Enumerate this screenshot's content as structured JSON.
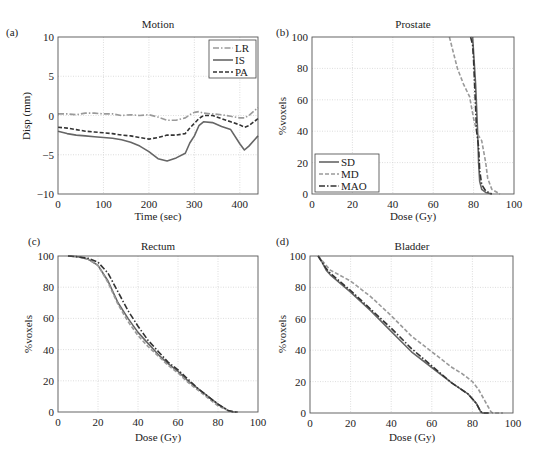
{
  "figure": {
    "panels": [
      {
        "id": "a",
        "label": "(a)",
        "title": "Motion",
        "xlabel": "Time (sec)",
        "ylabel": "Disp (mm)"
      },
      {
        "id": "b",
        "label": "(b)",
        "title": "Prostate",
        "xlabel": "Dose (Gy)",
        "ylabel": "%voxels"
      },
      {
        "id": "c",
        "label": "(c)",
        "title": "Rectum",
        "xlabel": "Dose (Gy)",
        "ylabel": "%voxels"
      },
      {
        "id": "d",
        "label": "(d)",
        "title": "Bladder",
        "xlabel": "Dose (Gy)",
        "ylabel": "%voxels"
      }
    ]
  },
  "chart_data": [
    {
      "panel": "(a)",
      "type": "line",
      "title": "Motion",
      "xlabel": "Time (sec)",
      "ylabel": "Disp (mm)",
      "xlim": [
        0,
        440
      ],
      "ylim": [
        -10,
        10
      ],
      "xticks": [
        0,
        100,
        200,
        300,
        400
      ],
      "yticks": [
        -10,
        -5,
        0,
        5,
        10
      ],
      "grid": true,
      "legend": {
        "position": "upper right",
        "entries": [
          "LR",
          "IS",
          "PA"
        ]
      },
      "x": [
        0,
        20,
        40,
        60,
        80,
        100,
        120,
        140,
        160,
        180,
        200,
        220,
        240,
        260,
        280,
        290,
        300,
        310,
        320,
        340,
        360,
        380,
        400,
        410,
        420,
        440
      ],
      "series": [
        {
          "name": "LR",
          "style": "dash-dot",
          "color": "#9a9a9a",
          "values": [
            0.2,
            0.2,
            0.1,
            0.3,
            0.3,
            0.2,
            0.2,
            0.0,
            0.1,
            0.0,
            0.1,
            -0.2,
            -0.6,
            -0.6,
            -0.3,
            0.1,
            0.4,
            0.5,
            0.3,
            0.2,
            0.1,
            -0.1,
            -0.3,
            -0.3,
            0.0,
            1.0
          ]
        },
        {
          "name": "IS",
          "style": "solid",
          "color": "#666666",
          "values": [
            -2.0,
            -2.3,
            -2.5,
            -2.6,
            -2.7,
            -2.8,
            -2.9,
            -3.1,
            -3.4,
            -3.9,
            -4.6,
            -5.5,
            -5.8,
            -5.4,
            -4.8,
            -3.5,
            -2.6,
            -1.3,
            -0.8,
            -0.9,
            -1.4,
            -1.8,
            -3.6,
            -4.4,
            -3.9,
            -2.6
          ]
        },
        {
          "name": "PA",
          "style": "dashed",
          "color": "#333333",
          "values": [
            -1.5,
            -1.6,
            -1.8,
            -2.0,
            -2.1,
            -2.2,
            -2.3,
            -2.5,
            -2.6,
            -2.8,
            -3.0,
            -2.8,
            -2.5,
            -2.5,
            -2.3,
            -1.6,
            -1.0,
            -0.4,
            0.0,
            0.0,
            -0.4,
            -0.8,
            -1.2,
            -1.5,
            -1.3,
            -0.4
          ]
        }
      ]
    },
    {
      "panel": "(b)",
      "type": "line",
      "title": "Prostate",
      "xlabel": "Dose (Gy)",
      "ylabel": "%voxels",
      "xlim": [
        0,
        100
      ],
      "ylim": [
        0,
        100
      ],
      "xticks": [
        0,
        20,
        40,
        60,
        80,
        100
      ],
      "yticks": [
        0,
        20,
        40,
        60,
        80,
        100
      ],
      "grid": true,
      "legend": {
        "position": "lower left",
        "entries": [
          "SD",
          "MD",
          "MAO"
        ]
      },
      "series": [
        {
          "name": "SD",
          "style": "solid",
          "color": "#666666",
          "x": [
            79.5,
            80.0,
            80.5,
            81.0,
            81.5,
            82.0,
            82.5,
            83.0,
            84.0,
            86.0,
            89.0
          ],
          "y": [
            100,
            90,
            80,
            70,
            55,
            40,
            20,
            8,
            3,
            1,
            0
          ]
        },
        {
          "name": "MD",
          "style": "dashed",
          "color": "#9a9a9a",
          "x": [
            68.0,
            70.0,
            72.0,
            75.0,
            78.0,
            80.0,
            82.0,
            84.0,
            86.0,
            87.0,
            89.0,
            93.0
          ],
          "y": [
            100,
            90,
            80,
            70,
            62,
            48,
            38,
            34,
            20,
            10,
            3,
            0
          ]
        },
        {
          "name": "MAO",
          "style": "dash-dot",
          "color": "#333333",
          "x": [
            78.5,
            79.5,
            80.0,
            80.5,
            81.0,
            81.5,
            82.5,
            83.0,
            84.0,
            86.0,
            89.0
          ],
          "y": [
            100,
            95,
            85,
            70,
            55,
            40,
            30,
            15,
            6,
            2,
            0
          ]
        }
      ]
    },
    {
      "panel": "(c)",
      "type": "line",
      "title": "Rectum",
      "xlabel": "Dose (Gy)",
      "ylabel": "%voxels",
      "xlim": [
        0,
        100
      ],
      "ylim": [
        0,
        100
      ],
      "xticks": [
        0,
        20,
        40,
        60,
        80,
        100
      ],
      "yticks": [
        0,
        20,
        40,
        60,
        80,
        100
      ],
      "grid": true,
      "series": [
        {
          "name": "SD",
          "style": "solid",
          "color": "#666666",
          "x": [
            5,
            10,
            15,
            20,
            25,
            30,
            35,
            40,
            45,
            50,
            55,
            60,
            65,
            70,
            75,
            80,
            85,
            88,
            90
          ],
          "y": [
            100,
            99.5,
            98,
            94,
            84,
            70,
            60,
            51,
            44,
            37,
            31,
            26,
            20,
            15,
            10,
            5,
            1,
            0,
            0
          ]
        },
        {
          "name": "MD",
          "style": "dashed",
          "color": "#9a9a9a",
          "x": [
            5,
            10,
            15,
            20,
            25,
            30,
            35,
            40,
            45,
            50,
            55,
            60,
            65,
            70,
            75,
            80,
            85,
            88,
            90
          ],
          "y": [
            100,
            99.5,
            98,
            94,
            83,
            69,
            58,
            49,
            42,
            36,
            30,
            25,
            19,
            14,
            9,
            4,
            1,
            0,
            0
          ]
        },
        {
          "name": "MAO",
          "style": "dash-dot",
          "color": "#333333",
          "x": [
            5,
            10,
            15,
            20,
            25,
            30,
            35,
            40,
            45,
            50,
            55,
            60,
            65,
            70,
            75,
            80,
            85,
            88,
            90
          ],
          "y": [
            100,
            99.5,
            98.5,
            96,
            89,
            77,
            65,
            55,
            46,
            39,
            32,
            27,
            21,
            15,
            10,
            5,
            1,
            0,
            0
          ]
        }
      ]
    },
    {
      "panel": "(d)",
      "type": "line",
      "title": "Bladder",
      "xlabel": "Dose (Gy)",
      "ylabel": "%voxels",
      "xlim": [
        0,
        100
      ],
      "ylim": [
        0,
        100
      ],
      "xticks": [
        0,
        20,
        40,
        60,
        80,
        100
      ],
      "yticks": [
        0,
        20,
        40,
        60,
        80,
        100
      ],
      "grid": true,
      "series": [
        {
          "name": "SD",
          "style": "solid",
          "color": "#666666",
          "x": [
            4,
            6,
            8,
            10,
            20,
            30,
            40,
            50,
            60,
            70,
            78,
            82,
            84,
            85,
            88
          ],
          "y": [
            100,
            96,
            91,
            88,
            77,
            65,
            52,
            39,
            29,
            19,
            12,
            6,
            1,
            0,
            0
          ]
        },
        {
          "name": "MD",
          "style": "dashed",
          "color": "#9a9a9a",
          "x": [
            4,
            6,
            8,
            10,
            20,
            30,
            40,
            50,
            60,
            70,
            75,
            80,
            83,
            86,
            89,
            90,
            95
          ],
          "y": [
            100,
            97,
            94,
            91,
            84,
            74,
            62,
            49,
            39,
            29,
            25,
            20,
            15,
            8,
            1,
            0,
            0
          ]
        },
        {
          "name": "MAO",
          "style": "dash-dot",
          "color": "#333333",
          "x": [
            4,
            6,
            8,
            10,
            20,
            30,
            40,
            50,
            60,
            70,
            78,
            82,
            84,
            85,
            88
          ],
          "y": [
            100,
            96,
            92,
            89,
            78,
            66,
            54,
            41,
            30,
            19,
            12,
            6,
            1,
            0,
            0
          ]
        }
      ]
    }
  ]
}
